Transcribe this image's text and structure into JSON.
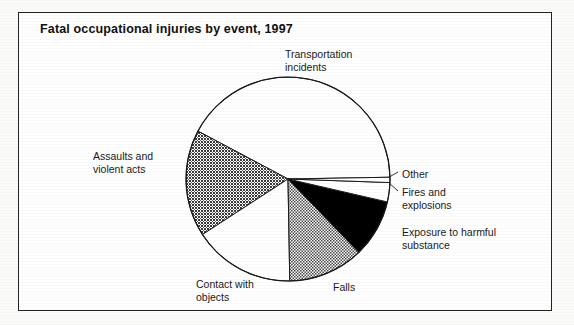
{
  "figure": {
    "title": "Fatal occupational injuries by event, 1997",
    "frame_color": "#2b2b2b",
    "background_color": "#ffffff"
  },
  "chart_data": {
    "type": "pie",
    "title": "Fatal occupational injuries by event, 1997",
    "subtitle": "",
    "xlabel": "",
    "ylabel": "",
    "legend_position": "none",
    "grid": false,
    "labels_placement": "outside-with-leader-lines",
    "categories": [
      "Transportation incidents",
      "Assaults and violent acts",
      "Contact with objects",
      "Falls",
      "Exposure to harmful substance",
      "Fires and explosions",
      "Other"
    ],
    "values": [
      42,
      17,
      16,
      12,
      9,
      3,
      1
    ],
    "units": "percent",
    "slices": [
      {
        "label": "Transportation incidents",
        "value": 42,
        "fill": "white",
        "fill_color": "#ffffff",
        "start_angle_deg": 1,
        "end_angle_deg": 152
      },
      {
        "label": "Assaults and violent acts",
        "value": 17,
        "fill": "dense-crosshatch",
        "fill_color": "#6b6b6b",
        "start_angle_deg": 152,
        "end_angle_deg": 213
      },
      {
        "label": "Contact with objects",
        "value": 16,
        "fill": "white",
        "fill_color": "#ffffff",
        "start_angle_deg": 213,
        "end_angle_deg": 271
      },
      {
        "label": "Falls",
        "value": 12,
        "fill": "checkerboard-dither",
        "fill_color": "#9a9a9a",
        "start_angle_deg": 271,
        "end_angle_deg": 314
      },
      {
        "label": "Exposure to harmful substance",
        "value": 9,
        "fill": "solid-black",
        "fill_color": "#000000",
        "start_angle_deg": 314,
        "end_angle_deg": 347
      },
      {
        "label": "Fires and explosions",
        "value": 3,
        "fill": "white",
        "fill_color": "#ffffff",
        "start_angle_deg": 347,
        "end_angle_deg": 358
      },
      {
        "label": "Other",
        "value": 1,
        "fill": "white",
        "fill_color": "#ffffff",
        "start_angle_deg": 358,
        "end_angle_deg": 361
      }
    ]
  },
  "labels": {
    "transportation": "Transportation\nincidents",
    "assaults": "Assaults and\nviolent acts",
    "contact": "Contact with\nobjects",
    "falls": "Falls",
    "exposure": "Exposure to harmful\nsubstance",
    "fires": "Fires and\nexplosions",
    "other": "Other"
  }
}
